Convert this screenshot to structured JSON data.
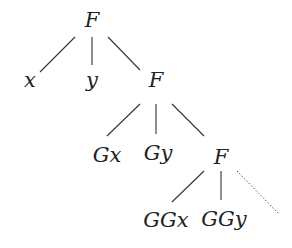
{
  "diagram": {
    "type": "tree",
    "nodes": [
      {
        "id": "n0",
        "label": "F",
        "x": 92,
        "y": 20
      },
      {
        "id": "n1",
        "label": "x",
        "x": 30,
        "y": 80
      },
      {
        "id": "n2",
        "label": "y",
        "x": 92,
        "y": 80
      },
      {
        "id": "n3",
        "label": "F",
        "x": 156,
        "y": 80
      },
      {
        "id": "n4",
        "label": "Gx",
        "x": 107,
        "y": 155
      },
      {
        "id": "n5",
        "label": "Gy",
        "x": 158,
        "y": 153
      },
      {
        "id": "n6",
        "label": "F",
        "x": 221,
        "y": 157
      },
      {
        "id": "n7",
        "label": "GGx",
        "x": 166,
        "y": 220
      },
      {
        "id": "n8",
        "label": "GGy",
        "x": 224,
        "y": 219
      }
    ],
    "edges": [
      {
        "from": "n0",
        "to": "n1",
        "x1": 75,
        "y1": 37,
        "x2": 40,
        "y2": 72,
        "style": "solid"
      },
      {
        "from": "n0",
        "to": "n2",
        "x1": 92,
        "y1": 37,
        "x2": 92,
        "y2": 65,
        "style": "solid"
      },
      {
        "from": "n0",
        "to": "n3",
        "x1": 108,
        "y1": 37,
        "x2": 140,
        "y2": 70,
        "style": "solid"
      },
      {
        "from": "n3",
        "to": "n4",
        "x1": 140,
        "y1": 104,
        "x2": 107,
        "y2": 136,
        "style": "solid"
      },
      {
        "from": "n3",
        "to": "n5",
        "x1": 156,
        "y1": 104,
        "x2": 156,
        "y2": 134,
        "style": "solid"
      },
      {
        "from": "n3",
        "to": "n6",
        "x1": 172,
        "y1": 104,
        "x2": 204,
        "y2": 136,
        "style": "solid"
      },
      {
        "from": "n6",
        "to": "n7",
        "x1": 204,
        "y1": 171,
        "x2": 172,
        "y2": 202,
        "style": "solid"
      },
      {
        "from": "n6",
        "to": "n8",
        "x1": 221,
        "y1": 171,
        "x2": 221,
        "y2": 200,
        "style": "solid"
      },
      {
        "from": "n6",
        "to": "more",
        "x1": 237,
        "y1": 171,
        "x2": 279,
        "y2": 214,
        "style": "dotted"
      }
    ]
  }
}
